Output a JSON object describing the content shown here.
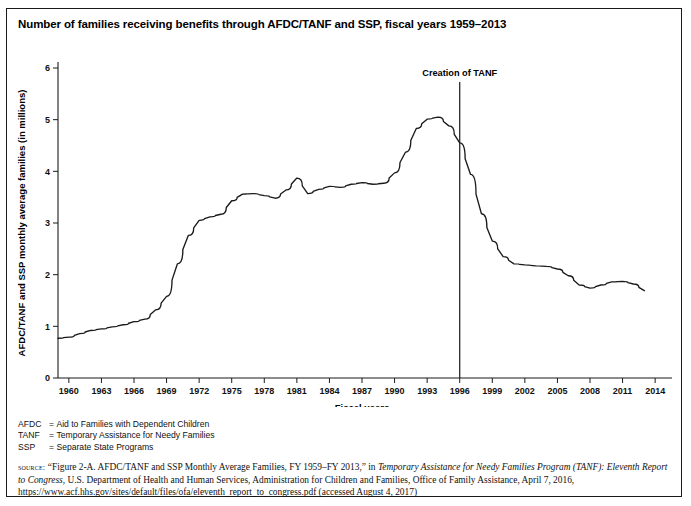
{
  "figure": {
    "title": "Number of families receiving benefits through AFDC/TANF and SSP, fiscal years 1959–2013"
  },
  "abbreviations": [
    {
      "key": "AFDC",
      "eq": "=",
      "value": "Aid to Families with Dependent Children"
    },
    {
      "key": "TANF",
      "eq": "=",
      "value": "Temporary Assistance for Needy Families"
    },
    {
      "key": "SSP",
      "eq": "=",
      "value": "Separate State Programs"
    }
  ],
  "source": {
    "label": "source:",
    "part1": " “Figure 2-A. AFDC/TANF and SSP Monthly Average Families, FY 1959–FY 2013,” in ",
    "italic1": "Temporary Assistance for Needy Families Program (TANF): Eleventh Report to Congress",
    "part2": ", U.S. Department of Health and Human Services, Administration for Children and Families, Office of Family Assistance, April 7, 2016, https://www.acf.hhs.gov/sites/default/files/ofa/eleventh_report_to_congress.pdf (accessed August 4, 2017)"
  },
  "chart_data": {
    "type": "line",
    "title": "Number of families receiving benefits through AFDC/TANF and SSP, fiscal years 1959–2013",
    "xlabel": "Fiscal years",
    "ylabel": "AFDC/TANF and SSP monthly average families (in millions)",
    "xlim": [
      1959,
      2015
    ],
    "ylim": [
      0,
      6
    ],
    "yticks": [
      0,
      1,
      2,
      3,
      4,
      5,
      6
    ],
    "xticks": [
      1960,
      1963,
      1966,
      1969,
      1972,
      1975,
      1978,
      1981,
      1984,
      1987,
      1990,
      1993,
      1996,
      1999,
      2002,
      2005,
      2008,
      2011,
      2014
    ],
    "grid": false,
    "legend": "none",
    "line_color": "#1a1a1a",
    "annotations": [
      {
        "text": "Creation of TANF",
        "x": 1996,
        "type": "vertical-line"
      }
    ],
    "series": [
      {
        "name": "AFDC/TANF and SSP monthly average families (in millions)",
        "x": [
          1959,
          1960,
          1961,
          1962,
          1963,
          1964,
          1965,
          1966,
          1967,
          1968,
          1969,
          1970,
          1971,
          1972,
          1973,
          1974,
          1975,
          1976,
          1977,
          1978,
          1979,
          1980,
          1981,
          1982,
          1983,
          1984,
          1985,
          1986,
          1987,
          1988,
          1989,
          1990,
          1991,
          1992,
          1993,
          1994,
          1995,
          1996,
          1997,
          1998,
          1999,
          2000,
          2001,
          2002,
          2003,
          2004,
          2005,
          2006,
          2007,
          2008,
          2009,
          2010,
          2011,
          2012,
          2013
        ],
        "values": [
          0.77,
          0.79,
          0.86,
          0.92,
          0.95,
          0.99,
          1.03,
          1.09,
          1.14,
          1.32,
          1.58,
          2.21,
          2.76,
          3.05,
          3.12,
          3.17,
          3.43,
          3.56,
          3.57,
          3.53,
          3.48,
          3.64,
          3.87,
          3.57,
          3.65,
          3.71,
          3.69,
          3.75,
          3.78,
          3.75,
          3.77,
          3.97,
          4.37,
          4.83,
          5.01,
          5.05,
          4.88,
          4.55,
          3.94,
          3.18,
          2.65,
          2.35,
          2.21,
          2.19,
          2.17,
          2.16,
          2.11,
          1.98,
          1.8,
          1.74,
          1.8,
          1.86,
          1.87,
          1.82,
          1.69
        ]
      }
    ]
  }
}
